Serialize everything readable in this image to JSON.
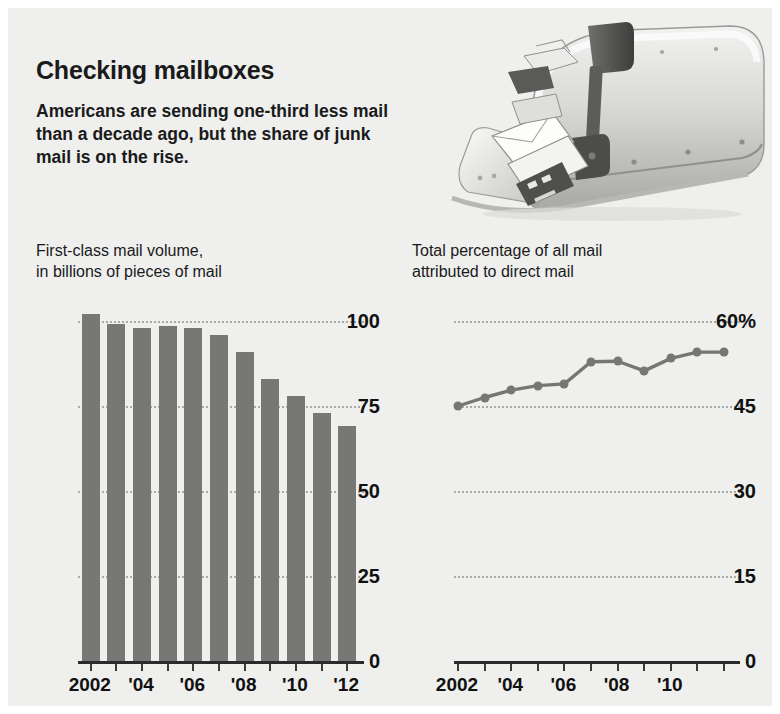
{
  "headline": "Checking mailboxes",
  "subhead": "Americans are sending one-third less mail than a decade ago, but the share of junk mail is on the rise.",
  "photo": {
    "alt": "open-mailbox-with-mail-and-raised-flag"
  },
  "colors": {
    "background": "#efefee",
    "bar": "#777775",
    "line": "#767674",
    "gridline": "#a9a9a9",
    "text": "#1a1a1a",
    "axis": "#2b2b2b"
  },
  "chart_data": [
    {
      "type": "bar",
      "id": "first-class-mail-volume",
      "title": "First-class mail volume, in billions of pieces of mail",
      "title_line1": "First-class mail volume,",
      "title_line2": "in billions of pieces of mail",
      "xlabel": "",
      "ylabel": "",
      "ylim": [
        0,
        105
      ],
      "yticks": [
        0,
        25,
        50,
        75,
        100
      ],
      "ytick_labels": [
        "0",
        "25",
        "50",
        "75",
        "100"
      ],
      "grid": true,
      "categories": [
        2002,
        2003,
        2004,
        2005,
        2006,
        2007,
        2008,
        2009,
        2010,
        2011,
        2012
      ],
      "xtick_labels": [
        "2002",
        "",
        "'04",
        "",
        "'06",
        "",
        "'08",
        "",
        "'10",
        "",
        "'12"
      ],
      "values": [
        102,
        99,
        98,
        98.5,
        98,
        96,
        91,
        83,
        78,
        73,
        69
      ]
    },
    {
      "type": "line",
      "id": "direct-mail-share",
      "title": "Total percentage of all mail attributed to direct mail",
      "title_line1": "Total percentage of all mail",
      "title_line2": "attributed to direct mail",
      "xlabel": "",
      "ylabel": "",
      "ylim": [
        0,
        60
      ],
      "yticks": [
        0,
        15,
        30,
        45,
        60
      ],
      "ytick_labels": [
        "0",
        "15",
        "30",
        "45",
        "60%"
      ],
      "grid": true,
      "markers": true,
      "categories": [
        2002,
        2003,
        2004,
        2005,
        2006,
        2007,
        2008,
        2009,
        2010,
        2011,
        2012
      ],
      "xtick_labels": [
        "2002",
        "",
        "'04",
        "",
        "'06",
        "",
        "'08",
        "",
        "'10",
        "",
        ""
      ],
      "values": [
        45,
        46.5,
        47.8,
        48.6,
        48.9,
        52.8,
        52.9,
        51.2,
        53.4,
        54.5,
        54.5
      ]
    }
  ]
}
